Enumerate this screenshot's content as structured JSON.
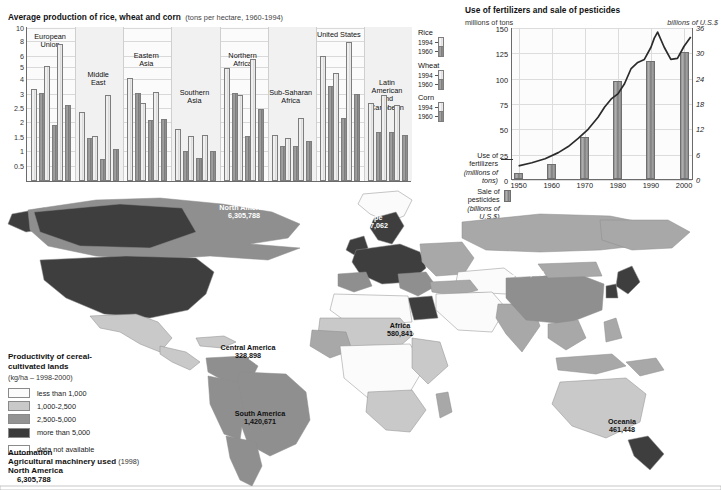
{
  "bar_chart": {
    "title": "Average production of rice, wheat and corn",
    "subtitle": "(tons per hectare, 1960-1994)",
    "y_ticks": [
      "10",
      "8",
      "6",
      "5",
      "4",
      "3",
      "2.5",
      "2",
      "1.5",
      "1",
      "0.5"
    ],
    "legend": [
      {
        "crop": "Rice",
        "years": [
          "1994",
          "1960"
        ]
      },
      {
        "crop": "Wheat",
        "years": [
          "1994",
          "1960"
        ]
      },
      {
        "crop": "Corn",
        "years": [
          "1994",
          "1960"
        ]
      }
    ],
    "groups": [
      {
        "label": "European\nUnion"
      },
      {
        "label": "Middle\nEast"
      },
      {
        "label": "Eastern\nAsia"
      },
      {
        "label": "Southern\nAsia"
      },
      {
        "label": "Northern\nAfrica"
      },
      {
        "label": "Sub-Saharan\nAfrica"
      },
      {
        "label": "United States"
      },
      {
        "label": "Latin American\nand\nCaribbean"
      }
    ]
  },
  "chart_data": [
    {
      "type": "bar",
      "title": "Average production of rice, wheat and corn",
      "subtitle": "(tons per hectare, 1960-1994)",
      "ylabel": "tons per hectare",
      "xlabel": "",
      "y_tick_values": [
        0.5,
        1,
        1.5,
        2,
        2.5,
        3,
        4,
        5,
        6,
        8,
        10
      ],
      "y_axis_note": "non-linear (compressed above 3)",
      "ylim": [
        0,
        10
      ],
      "grid": true,
      "legend_position": "right",
      "categories": [
        "European Union",
        "Middle East",
        "Eastern Asia",
        "Southern Asia",
        "Northern Africa",
        "Sub-Saharan Africa",
        "United States",
        "Latin American and Caribbean"
      ],
      "series": [
        {
          "name": "Rice 1994",
          "values": [
            3.4,
            2.4,
            4.2,
            1.8,
            5.0,
            1.6,
            6.1,
            2.7
          ]
        },
        {
          "name": "Rice 1960",
          "values": [
            3.1,
            1.5,
            3.1,
            1.05,
            3.1,
            1.2,
            3.6,
            1.7
          ]
        },
        {
          "name": "Wheat 1994",
          "values": [
            5.2,
            1.55,
            2.7,
            1.55,
            3.0,
            1.5,
            4.6,
            3.0
          ]
        },
        {
          "name": "Wheat 1960",
          "values": [
            1.95,
            0.75,
            2.1,
            0.8,
            1.55,
            1.2,
            2.2,
            1.7
          ]
        },
        {
          "name": "Corn 1994",
          "values": [
            7.7,
            3.0,
            3.2,
            1.6,
            5.8,
            2.2,
            8.1,
            2.65
          ]
        },
        {
          "name": "Corn 1960",
          "values": [
            2.65,
            1.1,
            2.15,
            1.05,
            2.5,
            1.4,
            3.05,
            1.6
          ]
        }
      ]
    },
    {
      "type": "line",
      "title": "Use of fertilizers and sale of pesticides",
      "left_axis_label": "millions of tons",
      "right_axis_label": "billions of U.S.$",
      "left_ticks": [
        "0",
        "25",
        "50",
        "75",
        "100",
        "125",
        "150"
      ],
      "right_ticks": [
        "0",
        "6",
        "12",
        "18",
        "24",
        "30",
        "36"
      ],
      "x_ticks": [
        "1950",
        "1960",
        "1970",
        "1980",
        "1990",
        "2000"
      ],
      "ylim": [
        0,
        150
      ],
      "y2lim": [
        0,
        36
      ],
      "xlim": [
        1950,
        2002
      ],
      "grid": true,
      "legend_position": "left",
      "series": [
        {
          "name": "Use of fertilizers (millions of tons)",
          "kind": "line",
          "axis": "left",
          "x": [
            1950,
            1954,
            1958,
            1962,
            1965,
            1968,
            1971,
            1974,
            1976,
            1978,
            1980,
            1982,
            1984,
            1986,
            1988,
            1990,
            1991,
            1992,
            1994,
            1996,
            1998,
            2000,
            2002
          ],
          "y": [
            14,
            17,
            21,
            27,
            33,
            41,
            50,
            62,
            72,
            80,
            85,
            95,
            110,
            116,
            119,
            131,
            140,
            146,
            131,
            119,
            120,
            132,
            141
          ]
        },
        {
          "name": "Sale of pesticides (billions of U.S.$)",
          "kind": "bar",
          "axis": "right",
          "x": [
            1950,
            1960,
            1970,
            1980,
            1990,
            2000
          ],
          "y": [
            1.5,
            3.6,
            10,
            23.3,
            28,
            30
          ]
        }
      ]
    }
  ],
  "fert_chart": {
    "title": "Use of fertilizers and sale of pesticides",
    "left_unit": "millions of tons",
    "right_unit": "billions of U.S.$",
    "legend": [
      {
        "label_line1": "Use of",
        "label_line2": "fertilizers",
        "label_line3": "(millions of tons)",
        "mark": "line"
      },
      {
        "label_line1": "Sale of pesticides",
        "label_line2": "(billions of U.S.$)",
        "label_line3": "",
        "mark": "bar"
      }
    ]
  },
  "map": {
    "labels": [
      {
        "name": "North America",
        "value": "6,305,788",
        "tone": "on-dark"
      },
      {
        "name": "Europe",
        "value": "12,137,062",
        "tone": "on-dark"
      },
      {
        "name": "Asia",
        "value": "9,145,623",
        "tone": "on-dark"
      },
      {
        "name": "Central America",
        "value": "328,898",
        "tone": "on-light"
      },
      {
        "name": "Africa",
        "value": "580,841",
        "tone": "on-light"
      },
      {
        "name": "South America",
        "value": "1,420,671",
        "tone": "on-light"
      },
      {
        "name": "Oceania",
        "value": "461,448",
        "tone": "on-light"
      }
    ]
  },
  "map_legend": {
    "title_line1": "Productivity of cereal-",
    "title_line2": "cultivated lands",
    "subtitle": "(kg/ha – 1998-2000)",
    "classes": [
      {
        "label": "less than 1,000",
        "color": "#fbfbfb"
      },
      {
        "label": "1,000-2,500",
        "color": "#c9c9c9"
      },
      {
        "label": "2,500-5,000",
        "color": "#939393"
      },
      {
        "label": "more than 5,000",
        "color": "#3a3a3a"
      }
    ],
    "na": {
      "label": "data not available",
      "color": "#ffffff"
    }
  },
  "automation": {
    "heading": "Automation",
    "subheading": "Agricultural machinery used",
    "year": "(1998)",
    "region": "North America",
    "value": "6,305,788"
  }
}
